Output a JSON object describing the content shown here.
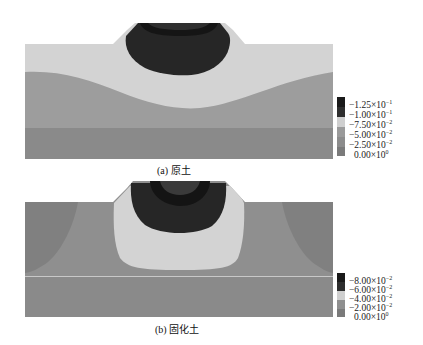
{
  "figure_a": {
    "caption": "(a) 原土",
    "legend": [
      {
        "label": "−1.25×10",
        "exp": "−1",
        "color": "#1a1a1a"
      },
      {
        "label": "−1.00×10",
        "exp": "−1",
        "color": "#2e2e2e"
      },
      {
        "label": "−7.50×10",
        "exp": "−2",
        "color": "#cfcfcf"
      },
      {
        "label": "−5.00×10",
        "exp": "−2",
        "color": "#9a9a9a"
      },
      {
        "label": "−2.50×10",
        "exp": "−2",
        "color": "#8c8c8c"
      },
      {
        "label": "0.00×10",
        "exp": "0",
        "color": "#7a7a7a"
      }
    ]
  },
  "figure_b": {
    "caption": "(b) 固化土",
    "legend": [
      {
        "label": "−8.00×10",
        "exp": "−2",
        "color": "#1a1a1a"
      },
      {
        "label": "−6.00×10",
        "exp": "−2",
        "color": "#2e2e2e"
      },
      {
        "label": "−4.00×10",
        "exp": "−2",
        "color": "#cfcfcf"
      },
      {
        "label": "−2.00×10",
        "exp": "−2",
        "color": "#8f8f8f"
      },
      {
        "label": "0.00×10",
        "exp": "0",
        "color": "#7a7a7a"
      }
    ]
  },
  "colors": {
    "darkest": "#1c1c1c",
    "dark": "#2b2b2b",
    "light": "#d3d3d3",
    "mid": "#9d9d9d",
    "midlow": "#8e8e8e",
    "low": "#7f7f7f"
  }
}
